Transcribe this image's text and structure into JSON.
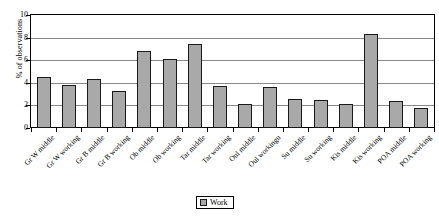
{
  "chart_data": {
    "type": "bar",
    "title": "",
    "xlabel": "",
    "ylabel": "% of observations",
    "ylim": [
      0,
      10
    ],
    "yticks": [
      0,
      2,
      4,
      6,
      8,
      10
    ],
    "grid": true,
    "legend": {
      "position": "bottom-center",
      "entries": [
        {
          "label": "Work",
          "color": "#a9a9a9"
        }
      ]
    },
    "series_name": "Work",
    "categories": [
      "Gr W middle",
      "Gr W working",
      "Gr B middle",
      "Gr B working",
      "Ob middle",
      "Ob working",
      "Tar middle",
      "Tar working",
      "Oul middle",
      "Oul workingu",
      "Su  middle",
      "Su working",
      "Kis middle",
      "Kis working",
      "POA middle",
      "POA working"
    ],
    "values": [
      4.5,
      3.85,
      4.35,
      3.25,
      6.85,
      6.1,
      7.4,
      3.75,
      2.15,
      3.6,
      2.6,
      2.5,
      2.1,
      8.35,
      2.35,
      1.75
    ]
  },
  "legend": {
    "label": "Work"
  },
  "axis": {
    "y_title": "% of observations"
  }
}
